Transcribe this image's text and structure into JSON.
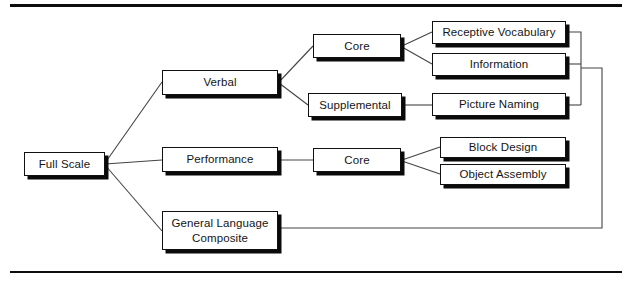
{
  "diagram": {
    "colors": {
      "box_border": "#111111",
      "box_fill": "#ffffff",
      "shadow": "#0a0a0a",
      "connector": "#444444",
      "rule": "#0d0d0d"
    },
    "rules": {
      "top_label": "top-divider",
      "bottom_label": "bottom-divider"
    },
    "nodes": [
      {
        "id": "full-scale",
        "label": "Full Scale",
        "lines": [
          "Full Scale"
        ],
        "x": 24,
        "y": 152,
        "w": 81,
        "h": 24
      },
      {
        "id": "verbal",
        "label": "Verbal",
        "lines": [
          "Verbal"
        ],
        "x": 162,
        "y": 70,
        "w": 116,
        "h": 25
      },
      {
        "id": "performance",
        "label": "Performance",
        "lines": [
          "Performance"
        ],
        "x": 162,
        "y": 147,
        "w": 116,
        "h": 25
      },
      {
        "id": "general-language-composite",
        "label": "General Language Composite",
        "lines": [
          "General Language",
          "Composite"
        ],
        "x": 162,
        "y": 211,
        "w": 116,
        "h": 39
      },
      {
        "id": "verbal-core",
        "label": "Core",
        "lines": [
          "Core"
        ],
        "x": 313,
        "y": 34,
        "w": 88,
        "h": 24
      },
      {
        "id": "verbal-supplemental",
        "label": "Supplemental",
        "lines": [
          "Supplemental"
        ],
        "x": 308,
        "y": 93,
        "w": 94,
        "h": 24
      },
      {
        "id": "performance-core",
        "label": "Core",
        "lines": [
          "Core"
        ],
        "x": 313,
        "y": 148,
        "w": 88,
        "h": 24
      },
      {
        "id": "receptive-vocabulary",
        "label": "Receptive Vocabulary",
        "lines": [
          "Receptive Vocabulary"
        ],
        "x": 432,
        "y": 21,
        "w": 134,
        "h": 23
      },
      {
        "id": "information",
        "label": "Information",
        "lines": [
          "Information"
        ],
        "x": 432,
        "y": 53,
        "w": 134,
        "h": 23
      },
      {
        "id": "picture-naming",
        "label": "Picture Naming",
        "lines": [
          "Picture Naming"
        ],
        "x": 432,
        "y": 93,
        "w": 134,
        "h": 23
      },
      {
        "id": "block-design",
        "label": "Block Design",
        "lines": [
          "Block Design"
        ],
        "x": 440,
        "y": 137,
        "w": 126,
        "h": 21
      },
      {
        "id": "object-assembly",
        "label": "Object Assembly",
        "lines": [
          "Object Assembly"
        ],
        "x": 440,
        "y": 164,
        "w": 126,
        "h": 21
      }
    ],
    "connections": [
      {
        "from": "full-scale",
        "to": "verbal",
        "kind": "diagonal"
      },
      {
        "from": "full-scale",
        "to": "performance",
        "kind": "straight"
      },
      {
        "from": "full-scale",
        "to": "general-language-composite",
        "kind": "diagonal"
      },
      {
        "from": "verbal",
        "to": "verbal-core",
        "kind": "diagonal"
      },
      {
        "from": "verbal",
        "to": "verbal-supplemental",
        "kind": "diagonal"
      },
      {
        "from": "verbal-core",
        "to": "receptive-vocabulary",
        "kind": "diagonal"
      },
      {
        "from": "verbal-core",
        "to": "information",
        "kind": "diagonal"
      },
      {
        "from": "verbal-supplemental",
        "to": "picture-naming",
        "kind": "straight"
      },
      {
        "from": "performance",
        "to": "performance-core",
        "kind": "straight"
      },
      {
        "from": "performance-core",
        "to": "block-design",
        "kind": "diagonal"
      },
      {
        "from": "performance-core",
        "to": "object-assembly",
        "kind": "diagonal"
      },
      {
        "from": "receptive-vocabulary",
        "to": "language-bus",
        "kind": "orthogonal"
      },
      {
        "from": "information",
        "to": "language-bus",
        "kind": "orthogonal"
      },
      {
        "from": "picture-naming",
        "to": "language-bus",
        "kind": "orthogonal"
      },
      {
        "from": "language-bus",
        "to": "general-language-composite",
        "kind": "orthogonal"
      }
    ]
  }
}
